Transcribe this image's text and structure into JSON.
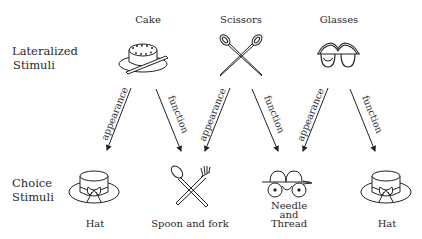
{
  "rows": {
    "lateralized": {
      "line1": "Lateralized",
      "line2": "Stimuli"
    },
    "choice": {
      "line1": "Choice",
      "line2": "Stimuli"
    }
  },
  "lateralized_stimuli": [
    {
      "label": "Cake",
      "icon": "cake-icon"
    },
    {
      "label": "Scissors",
      "icon": "scissors-icon"
    },
    {
      "label": "Glasses",
      "icon": "glasses-icon"
    }
  ],
  "choice_stimuli": [
    {
      "label": "Hat",
      "icon": "hat-icon"
    },
    {
      "label": "Spoon and fork",
      "icon": "spoon-fork-icon"
    },
    {
      "label_lines": [
        "Needle",
        "and",
        "Thread"
      ],
      "icon": "needle-thread-icon"
    },
    {
      "label": "Hat",
      "icon": "hat-icon"
    }
  ],
  "arrows": [
    {
      "from": "Cake",
      "to": "Hat",
      "label": "appearance"
    },
    {
      "from": "Cake",
      "to": "Spoon and fork",
      "label": "function"
    },
    {
      "from": "Scissors",
      "to": "Spoon and fork",
      "label": "appearance"
    },
    {
      "from": "Scissors",
      "to": "Needle and Thread",
      "label": "function"
    },
    {
      "from": "Glasses",
      "to": "Needle and Thread",
      "label": "appearance"
    },
    {
      "from": "Glasses",
      "to": "Hat",
      "label": "function"
    }
  ]
}
